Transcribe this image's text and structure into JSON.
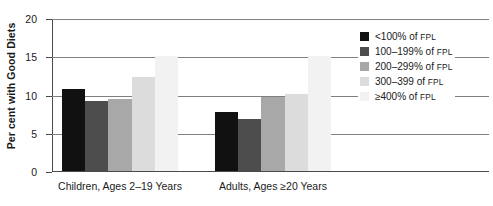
{
  "chart_data": {
    "type": "bar",
    "title": "",
    "xlabel": "",
    "ylabel": "Per cent with Good Diets",
    "ylim": [
      0,
      20
    ],
    "yticks": [
      0,
      5,
      10,
      15,
      20
    ],
    "ytick_labels": [
      "0",
      "5",
      "10",
      "15",
      "20"
    ],
    "grid": true,
    "legend_position": "right",
    "categories": [
      "Children, Ages 2–19 Years",
      "Adults, Ages ≥20 Years"
    ],
    "series": [
      {
        "name": "<100% of FPL",
        "values": [
          10.8,
          7.8
        ]
      },
      {
        "name": "100–199% of FPL",
        "values": [
          9.3,
          6.9
        ]
      },
      {
        "name": "200–299% of FPL",
        "values": [
          9.5,
          9.8
        ]
      },
      {
        "name": "300–399 of FPL",
        "values": [
          12.4,
          10.2
        ]
      },
      {
        "name": "≥400% of FPL",
        "values": [
          15.2,
          15.2
        ]
      }
    ],
    "colors": [
      "#111111",
      "#4d4d4d",
      "#a8a8a8",
      "#dcdcdc",
      "#f2f2f2"
    ]
  },
  "legend": {
    "items": [
      {
        "main": "<100% of ",
        "small": "FPL"
      },
      {
        "main": "100–199% of ",
        "small": "FPL"
      },
      {
        "main": "200–299% of ",
        "small": "FPL"
      },
      {
        "main": "300–399 of ",
        "small": "FPL"
      },
      {
        "main": "≥400% of ",
        "small": "FPL"
      }
    ]
  }
}
